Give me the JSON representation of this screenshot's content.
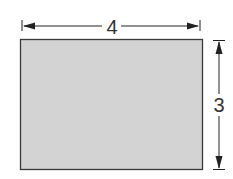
{
  "diagram": {
    "shape": "rectangle",
    "fill_color": "#d2d2d2",
    "stroke_color": "#333333",
    "width_label": "4",
    "height_label": "3"
  }
}
